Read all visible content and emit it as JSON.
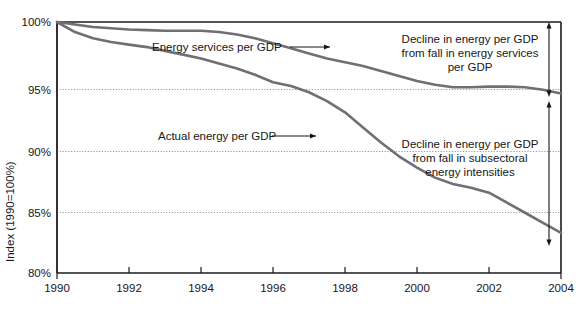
{
  "figure": {
    "partial_title_top": "",
    "background": "#ffffff",
    "frame_color": "#1c1b20",
    "series_color": "#6f6f74",
    "gridline_color": "#9a9a9e",
    "text_color": "#17161a"
  },
  "axes": {
    "y_axis_title": "Index (1990=100%)",
    "y_ticks": [
      "100%",
      "95%",
      "90%",
      "85%",
      "80%"
    ],
    "y_tick_values": [
      100,
      95,
      90,
      85,
      80
    ],
    "x_ticks": [
      "1990",
      "1992",
      "1994",
      "1996",
      "1998",
      "2000",
      "2002",
      "2004"
    ],
    "x_tick_values": [
      1990,
      1992,
      1994,
      1996,
      1998,
      2000,
      2002,
      2004
    ]
  },
  "series_labels": {
    "upper": "Energy services per GDP",
    "lower": "Actual energy per GDP"
  },
  "annotations": {
    "upper_bracket": {
      "line1": "Decline in energy per GDP",
      "line2": "from fall in energy services",
      "line3": "per GDP"
    },
    "lower_bracket": {
      "line1": "Decline in energy per GDP",
      "line2": "from fall in subsectoral",
      "line3": "energy intensities"
    }
  },
  "chart_data": {
    "type": "line",
    "title": "",
    "xlabel": "",
    "ylabel": "Index (1990=100%)",
    "xlim": [
      1990,
      2004
    ],
    "ylim": [
      80,
      100
    ],
    "grid": true,
    "grid_axis": "y",
    "legend_position": "inline-labels",
    "x": [
      1990,
      1990.5,
      1991,
      1991.5,
      1992,
      1992.5,
      1993,
      1993.5,
      1994,
      1994.5,
      1995,
      1995.5,
      1996,
      1996.5,
      1997,
      1997.5,
      1998,
      1998.5,
      1999,
      1999.5,
      2000,
      2000.5,
      2001,
      2001.5,
      2002,
      2002.5,
      2003,
      2003.5,
      2004
    ],
    "series": [
      {
        "name": "Energy services per GDP",
        "values": [
          100.0,
          99.8,
          99.6,
          99.5,
          99.4,
          99.35,
          99.3,
          99.3,
          99.3,
          99.2,
          99.0,
          98.7,
          98.3,
          97.9,
          97.5,
          97.1,
          96.8,
          96.5,
          96.1,
          95.7,
          95.3,
          95.0,
          94.8,
          94.8,
          94.85,
          94.85,
          94.8,
          94.6,
          94.3
        ]
      },
      {
        "name": "Actual energy per GDP",
        "values": [
          100.0,
          99.2,
          98.7,
          98.4,
          98.2,
          98.0,
          97.7,
          97.4,
          97.1,
          96.7,
          96.3,
          95.8,
          95.2,
          94.9,
          94.4,
          93.7,
          92.8,
          91.6,
          90.4,
          89.3,
          88.4,
          87.6,
          87.1,
          86.8,
          86.4,
          85.6,
          84.8,
          84.0,
          83.2
        ]
      }
    ],
    "annotations": [
      {
        "text": "Decline in energy per GDP from fall in energy services per GDP",
        "bracket_from": 100,
        "bracket_to": 94.3,
        "at_x": 2004
      },
      {
        "text": "Decline in energy per GDP from fall in subsectoral energy intensities",
        "bracket_from": 94.3,
        "bracket_to": 83.2,
        "at_x": 2004
      }
    ]
  }
}
